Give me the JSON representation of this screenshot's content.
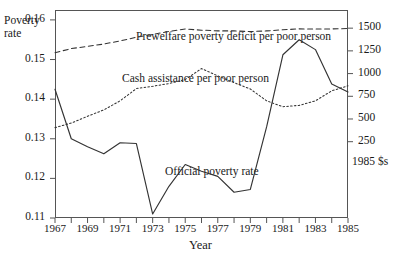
{
  "chart_data": {
    "type": "line",
    "title": "",
    "xlabel": "Year",
    "ylabel_left": "Poverty\nrate",
    "ylabel_left_line1": "Poverty",
    "ylabel_left_line2": "rate",
    "ylabel_right_units": "1985 $s",
    "grid": false,
    "legend": "inline-annotations",
    "x": [
      1967,
      1968,
      1969,
      1970,
      1971,
      1972,
      1973,
      1974,
      1975,
      1976,
      1977,
      1978,
      1979,
      1980,
      1981,
      1982,
      1983,
      1984,
      1985
    ],
    "xlim": [
      1967,
      1985
    ],
    "xticks_all": [
      1967,
      1968,
      1969,
      1970,
      1971,
      1972,
      1973,
      1974,
      1975,
      1976,
      1977,
      1978,
      1979,
      1980,
      1981,
      1982,
      1983,
      1984,
      1985
    ],
    "xtick_labels": [
      "1967",
      "1969",
      "1971",
      "1973",
      "1975",
      "1977",
      "1979",
      "1981",
      "1983",
      "1985"
    ],
    "xtick_label_values": [
      1967,
      1969,
      1971,
      1973,
      1975,
      1977,
      1979,
      1981,
      1983,
      1985
    ],
    "ylim_left": [
      0.11,
      0.1625
    ],
    "yticks_left": [
      0.11,
      0.12,
      0.13,
      0.14,
      0.15,
      0.16
    ],
    "ytick_labels_left": [
      "0.11",
      "0.12",
      "0.13",
      "0.14",
      "0.15",
      "0.16"
    ],
    "ylim_right": [
      -590,
      1700
    ],
    "yticks_right": [
      250,
      500,
      750,
      1000,
      1250,
      1500
    ],
    "ytick_labels_right": [
      "250",
      "500",
      "750",
      "1000",
      "1250",
      "1500"
    ],
    "series": [
      {
        "name": "Official poverty rate",
        "axis": "left",
        "style": "solid",
        "label_text": "Official poverty rate",
        "values": [
          0.1425,
          0.13,
          0.128,
          0.1262,
          0.129,
          0.1288,
          0.111,
          0.118,
          0.1235,
          0.1218,
          0.1205,
          0.1165,
          0.1172,
          0.133,
          0.1512,
          0.155,
          0.1525,
          0.1438,
          0.1418
        ]
      },
      {
        "name": "Prewelfare poverty deficit per poor person",
        "axis": "right",
        "style": "dashed",
        "label_text": "Prewelfare poverty deficit per poor person",
        "values": [
          1230,
          1275,
          1300,
          1325,
          1360,
          1400,
          1430,
          1465,
          1490,
          1478,
          1470,
          1470,
          1462,
          1470,
          1482,
          1492,
          1490,
          1492,
          1496
        ]
      },
      {
        "name": "Cash assistance per poor person",
        "axis": "right",
        "style": "dotted",
        "label_text": "Cash assistance per poor person",
        "values": [
          405,
          455,
          530,
          600,
          700,
          835,
          860,
          890,
          935,
          1055,
          975,
          900,
          830,
          700,
          635,
          650,
          700,
          810,
          865
        ]
      }
    ]
  }
}
